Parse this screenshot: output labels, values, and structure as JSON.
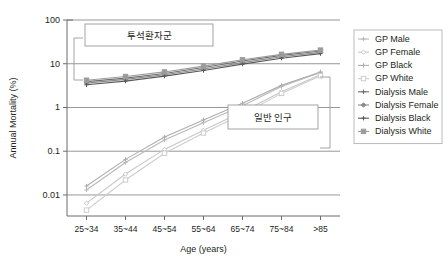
{
  "chart_data": {
    "type": "line",
    "title": "",
    "xlabel": "Age (years)",
    "ylabel": "Annual Mortality (%)",
    "categories": [
      "25~34",
      "35~44",
      "45~54",
      "55~64",
      "65~74",
      "75~84",
      ">85"
    ],
    "yscale": "log",
    "ylim": [
      0.003,
      100
    ],
    "yticks": [
      "100",
      "10",
      "1",
      "0.1",
      "0.01"
    ],
    "ytick_values": [
      100,
      10,
      1,
      0.1,
      0.01
    ],
    "grid": true,
    "legend_position": "right",
    "series": [
      {
        "name": "GP Male",
        "color": "#b9b9b9",
        "marker": "cross",
        "values": [
          0.013,
          0.055,
          0.18,
          0.45,
          1.1,
          3.0,
          6.3
        ]
      },
      {
        "name": "GP Female",
        "color": "#c7c7c7",
        "marker": "open-diamond",
        "values": [
          0.0065,
          0.03,
          0.11,
          0.3,
          0.8,
          2.3,
          5.6
        ]
      },
      {
        "name": "GP Black",
        "color": "#aeaeae",
        "marker": "plus",
        "values": [
          0.016,
          0.065,
          0.21,
          0.52,
          1.25,
          3.2,
          6.5
        ]
      },
      {
        "name": "GP White",
        "color": "#cdcdcd",
        "marker": "open-square",
        "values": [
          0.0045,
          0.022,
          0.09,
          0.26,
          0.7,
          2.1,
          5.3
        ]
      },
      {
        "name": "Dialysis Male",
        "color": "#6e6e6e",
        "marker": "cross",
        "values": [
          3.9,
          4.7,
          6.0,
          8.2,
          11.5,
          15.5,
          19.5
        ]
      },
      {
        "name": "Dialysis Female",
        "color": "#8a8a8a",
        "marker": "filled-diamond",
        "values": [
          3.6,
          4.4,
          5.6,
          7.6,
          10.6,
          14.4,
          18.2
        ]
      },
      {
        "name": "Dialysis Black",
        "color": "#5a5a5a",
        "marker": "plus",
        "values": [
          3.3,
          4.0,
          5.2,
          7.0,
          9.8,
          13.4,
          17.0
        ]
      },
      {
        "name": "Dialysis White",
        "color": "#9b9b9b",
        "marker": "filled-square",
        "values": [
          4.2,
          5.1,
          6.5,
          8.8,
          12.3,
          16.4,
          20.5
        ]
      }
    ],
    "annotations": [
      {
        "text": "투석환자군",
        "group": "dialysis"
      },
      {
        "text": "일반 인구",
        "group": "general-population"
      }
    ]
  },
  "legend": {
    "items": [
      {
        "label": "GP Male"
      },
      {
        "label": "GP Female"
      },
      {
        "label": "GP Black"
      },
      {
        "label": "GP White"
      },
      {
        "label": "Dialysis Male"
      },
      {
        "label": "Dialysis Female"
      },
      {
        "label": "Dialysis Black"
      },
      {
        "label": "Dialysis White"
      }
    ]
  }
}
